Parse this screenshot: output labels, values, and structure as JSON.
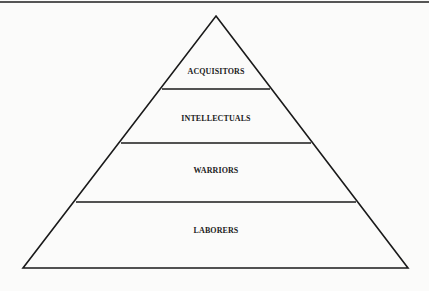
{
  "diagram": {
    "type": "pyramid",
    "tiers": [
      {
        "label": "ACQUISITORS",
        "level": 1
      },
      {
        "label": "INTELLECTUALS",
        "level": 2
      },
      {
        "label": "WARRIORS",
        "level": 3
      },
      {
        "label": "LABORERS",
        "level": 4
      }
    ]
  }
}
